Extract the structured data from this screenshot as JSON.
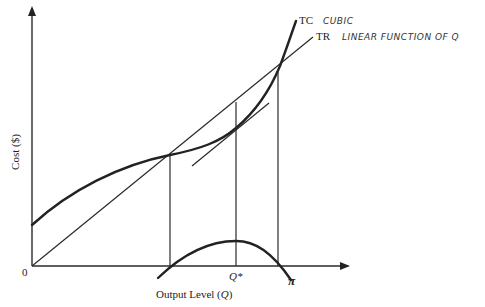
{
  "diagram": {
    "axes": {
      "x_label": "Output Level (Q)",
      "x_label_prefix": "Output Level (",
      "x_label_var": "Q",
      "x_label_suffix": ")",
      "y_label": "Cost ($)",
      "origin_label": "0"
    },
    "curves": {
      "tc": {
        "label": "TC",
        "annotation": "CUBIC"
      },
      "tr": {
        "label": "TR",
        "annotation": "LINEAR FUNCTION OF Q"
      },
      "profit": {
        "label": "π"
      }
    },
    "markers": {
      "q_star": "Q*"
    },
    "geometry": {
      "origin": [
        32,
        266
      ],
      "y_axis_top": [
        32,
        6
      ],
      "x_axis_end": [
        350,
        266
      ],
      "tc_intercept": [
        32,
        225
      ],
      "tr_tc_intersections": [
        [
          170,
          155
        ],
        [
          278,
          70
        ]
      ],
      "q_star_x": 236,
      "profit_peak": [
        236,
        241
      ]
    }
  }
}
